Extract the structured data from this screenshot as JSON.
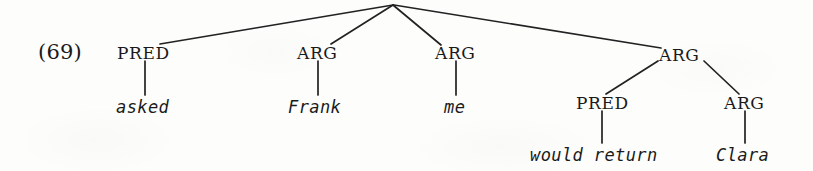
{
  "example": {
    "number_label": "(69)"
  },
  "tree": {
    "root": {
      "label": "",
      "x": 393,
      "y": 4
    },
    "nodes": [
      {
        "id": "pred-asked",
        "label": "PRED",
        "x": 145,
        "y": 53,
        "text_x": 117,
        "text_y": 45
      },
      {
        "id": "arg-frank",
        "label": "ARG",
        "x": 318,
        "y": 53,
        "text_x": 297,
        "text_y": 45
      },
      {
        "id": "arg-me",
        "label": "ARG",
        "x": 456,
        "y": 53,
        "text_x": 435,
        "text_y": 45
      },
      {
        "id": "arg-clause",
        "label": "ARG",
        "x": 680,
        "y": 55,
        "text_x": 659,
        "text_y": 47
      },
      {
        "id": "pred-would-return",
        "label": "PRED",
        "x": 602,
        "y": 103,
        "text_x": 576,
        "text_y": 95
      },
      {
        "id": "arg-clara",
        "label": "ARG",
        "x": 745,
        "y": 103,
        "text_x": 724,
        "text_y": 95
      }
    ],
    "terminals": [
      {
        "id": "word-asked",
        "label": "asked",
        "x": 145,
        "text_x": 116,
        "text_y": 99
      },
      {
        "id": "word-frank",
        "label": "Frank",
        "x": 318,
        "text_x": 288,
        "text_y": 99
      },
      {
        "id": "word-me",
        "label": "me",
        "x": 456,
        "text_x": 444,
        "text_y": 99
      },
      {
        "id": "word-would-return",
        "label": "would return",
        "x": 602,
        "text_x": 530,
        "text_y": 147
      },
      {
        "id": "word-clara",
        "label": "Clara",
        "x": 745,
        "text_x": 716,
        "text_y": 147
      }
    ],
    "edges": [
      {
        "id": "edge-root-pred-asked",
        "x1": 393,
        "y1": 5,
        "x2": 160,
        "y2": 44
      },
      {
        "id": "edge-root-arg-frank",
        "x1": 393,
        "y1": 5,
        "x2": 331,
        "y2": 44
      },
      {
        "id": "edge-root-arg-me",
        "x1": 393,
        "y1": 5,
        "x2": 441,
        "y2": 45
      },
      {
        "id": "edge-root-arg-clause",
        "x1": 394,
        "y1": 5,
        "x2": 661,
        "y2": 48
      },
      {
        "id": "edge-clause-pred",
        "x1": 658,
        "y1": 61,
        "x2": 606,
        "y2": 94
      },
      {
        "id": "edge-clause-arg-clara",
        "x1": 704,
        "y1": 61,
        "x2": 739,
        "y2": 94
      }
    ],
    "stems": [
      {
        "id": "stem-pred-asked",
        "x": 145,
        "y1": 61,
        "y2": 95
      },
      {
        "id": "stem-arg-frank",
        "x": 318,
        "y1": 61,
        "y2": 95
      },
      {
        "id": "stem-arg-me",
        "x": 456,
        "y1": 61,
        "y2": 95
      },
      {
        "id": "stem-pred-would-return",
        "x": 602,
        "y1": 111,
        "y2": 143
      },
      {
        "id": "stem-arg-clara",
        "x": 745,
        "y1": 111,
        "y2": 143
      }
    ]
  },
  "style": {
    "ink_color": "#1a1a1a",
    "line_color": "#222222",
    "background_color": "#fdfdfc"
  }
}
